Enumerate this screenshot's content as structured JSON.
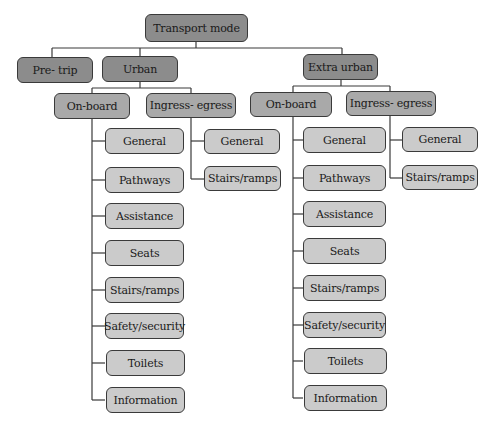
{
  "colors": {
    "root_fill": "#8c8c8c",
    "category_fill": "#8c8c8c",
    "subcategory_fill": "#a9a9a9",
    "leaf_fill": "#cbcbcb",
    "border": "#3a3a3a",
    "connector": "#3a3a3a"
  },
  "root": {
    "label": "Transport mode"
  },
  "categories": {
    "pre_trip": {
      "label": "Pre- trip"
    },
    "urban": {
      "label": "Urban",
      "on_board": {
        "label": "On-board",
        "items": [
          "General",
          "Pathways",
          "Assistance",
          "Seats",
          "Stairs/ramps",
          "Safety/security",
          "Toilets",
          "Information"
        ]
      },
      "ingress_egress": {
        "label": "Ingress- egress",
        "items": [
          "General",
          "Stairs/ramps"
        ]
      }
    },
    "extra_urban": {
      "label": "Extra urban",
      "on_board": {
        "label": "On-board",
        "items": [
          "General",
          "Pathways",
          "Assistance",
          "Seats",
          "Stairs/ramps",
          "Safety/security",
          "Toilets",
          "Information"
        ]
      },
      "ingress_egress": {
        "label": "Ingress- egress",
        "items": [
          "General",
          "Stairs/ramps"
        ]
      }
    }
  }
}
